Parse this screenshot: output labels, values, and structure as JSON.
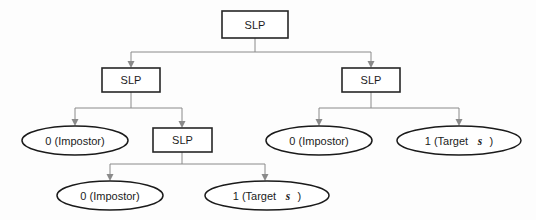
{
  "diagram": {
    "background_color": "#fdfdfd",
    "box_border_color": "#262626",
    "ellipse_border_color": "#1a1a1a",
    "edge_color": "#8a8a8a",
    "text_color": "#1c1c1c",
    "nodes": {
      "root": {
        "label": "SLP",
        "type": "box",
        "x": 255,
        "y": 24
      },
      "left_slp": {
        "label": "SLP",
        "type": "box",
        "x": 131,
        "y": 80
      },
      "right_slp": {
        "label": "SLP",
        "type": "box",
        "x": 371,
        "y": 80
      },
      "inner_slp": {
        "label": "SLP",
        "type": "box",
        "x": 182,
        "y": 140
      },
      "leaf_l_impostor": {
        "label_prefix": "0 (Impostor)",
        "type": "ellipse",
        "x": 75,
        "y": 140
      },
      "leaf_r_impostor": {
        "label_prefix": "0 (Impostor)",
        "type": "ellipse",
        "x": 319,
        "y": 140
      },
      "leaf_r_target": {
        "label_prefix": "1 (Target",
        "label_symbol": "s",
        "label_suffix": ")",
        "type": "ellipse",
        "x": 459,
        "y": 140
      },
      "leaf_b_impostor": {
        "label_prefix": "0 (Impostor)",
        "type": "ellipse",
        "x": 110,
        "y": 195
      },
      "leaf_b_target": {
        "label_prefix": "1 (Target",
        "label_symbol": "s",
        "label_suffix": ")",
        "type": "ellipse",
        "x": 265,
        "y": 195
      }
    },
    "edges": [
      {
        "from": "root",
        "to": "left_slp"
      },
      {
        "from": "root",
        "to": "right_slp"
      },
      {
        "from": "left_slp",
        "to": "leaf_l_impostor"
      },
      {
        "from": "left_slp",
        "to": "inner_slp"
      },
      {
        "from": "right_slp",
        "to": "leaf_r_impostor"
      },
      {
        "from": "right_slp",
        "to": "leaf_r_target"
      },
      {
        "from": "inner_slp",
        "to": "leaf_b_impostor"
      },
      {
        "from": "inner_slp",
        "to": "leaf_b_target"
      }
    ]
  }
}
